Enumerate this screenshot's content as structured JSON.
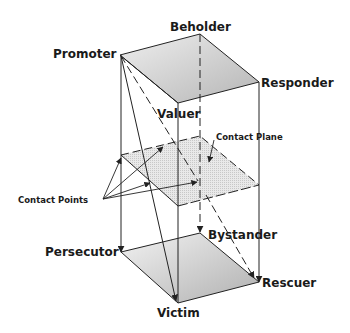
{
  "diagram": {
    "title": "",
    "nodes": {
      "beholder": "Beholder",
      "promoter": "Promoter",
      "responder": "Responder",
      "valuer": "Valuer",
      "persecutor": "Persecutor",
      "bystander": "Bystander",
      "rescuer": "Rescuer",
      "victim": "Victim"
    },
    "annotations": {
      "contact_plane": "Contact Plane",
      "contact_points": "Contact Points"
    },
    "colors": {
      "line": "#222222",
      "plane_fill": "#d6d6d6",
      "plane_fill_dark": "#b8b8b8",
      "background": "#ffffff"
    }
  }
}
